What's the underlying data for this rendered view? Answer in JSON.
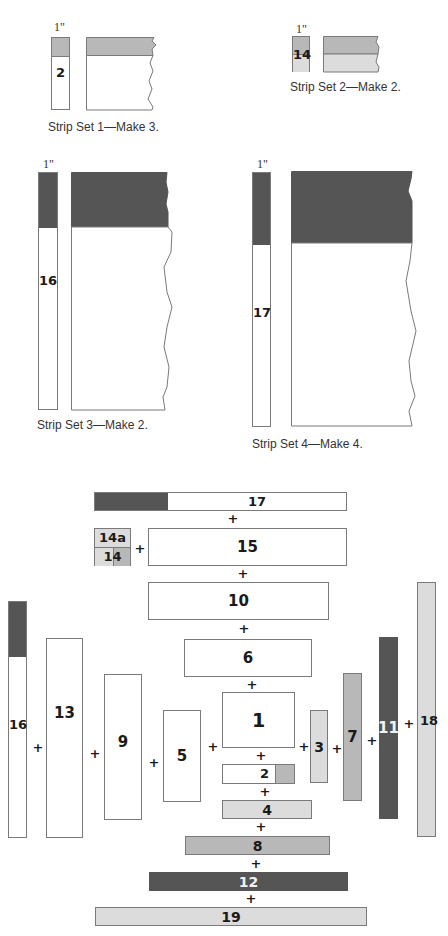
{
  "strip_sets": [
    {
      "caption": "Strip Set 1—Make 3.",
      "width_label": "1\"",
      "piece_label": "2"
    },
    {
      "caption": "Strip Set 2—Make 2.",
      "width_label": "1\"",
      "piece_label": "14"
    },
    {
      "caption": "Strip Set 3—Make 2.",
      "width_label": "1\"",
      "piece_label": "16"
    },
    {
      "caption": "Strip Set 4—Make 4.",
      "width_label": "1\"",
      "piece_label": "17"
    }
  ],
  "assembly": {
    "plus": "+",
    "pieces": {
      "p1": "1",
      "p2": "2",
      "p3": "3",
      "p4": "4",
      "p5": "5",
      "p6": "6",
      "p7": "7",
      "p8": "8",
      "p9": "9",
      "p10": "10",
      "p11": "11",
      "p12": "12",
      "p13": "13",
      "p14": "14",
      "p14a": "14a",
      "p15": "15",
      "p16": "16",
      "p17": "17",
      "p18": "18",
      "p19": "19"
    }
  },
  "colors": {
    "white": "#ffffff",
    "light_gray": "#dcdcdc",
    "medium_gray": "#b8b8b8",
    "dark_gray": "#555555"
  }
}
